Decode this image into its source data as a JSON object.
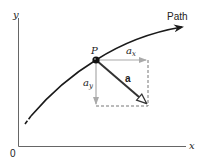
{
  "diagram": {
    "axes": {
      "x_label": "x",
      "y_label": "y",
      "origin_label": "0"
    },
    "path": {
      "label": "Path"
    },
    "point": {
      "label": "P"
    },
    "vectors": {
      "acceleration": {
        "label": "a"
      },
      "x_component": {
        "label": "a",
        "subscript": "x"
      },
      "y_component": {
        "label": "a",
        "subscript": "y"
      }
    },
    "colors": {
      "curve": "#1a1a1a",
      "axes": "#555555",
      "components": "#999999",
      "dashed": "#666666",
      "vector": "#333333"
    }
  }
}
